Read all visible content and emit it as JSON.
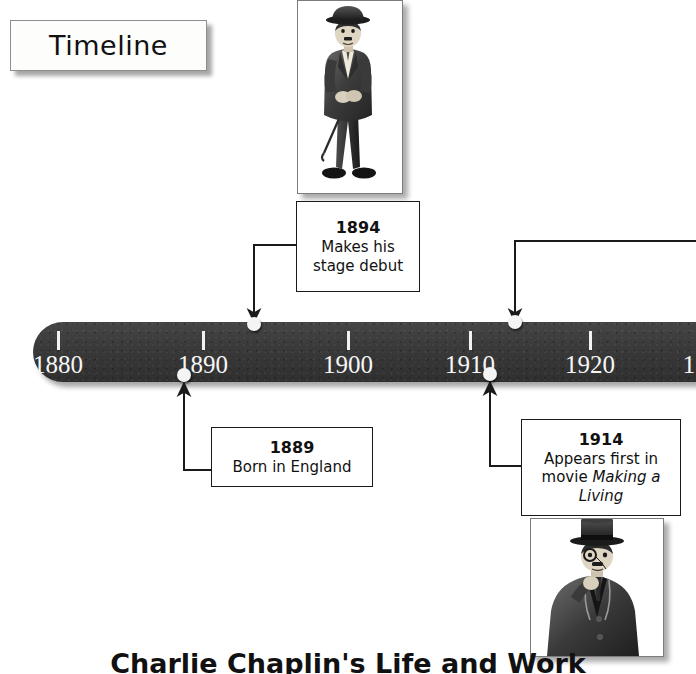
{
  "title": {
    "label": "Timeline"
  },
  "caption": {
    "text": "Charlie Chaplin's Life and Work"
  },
  "axis": {
    "ticks": [
      {
        "label": "1880",
        "x": 58
      },
      {
        "label": "1890",
        "x": 203
      },
      {
        "label": "1900",
        "x": 348
      },
      {
        "label": "1910",
        "x": 470
      },
      {
        "label": "1920",
        "x": 590
      },
      {
        "label": "1",
        "x": 689
      }
    ]
  },
  "events": [
    {
      "id": "event-1889",
      "year": "1889",
      "description": "Born in England",
      "description_italic": "",
      "dot_x": 184,
      "dot_y": 375,
      "box_x": 211,
      "box_y": 427,
      "box_w": 160,
      "box_h": 58,
      "side": "below"
    },
    {
      "id": "event-1894",
      "year": "1894",
      "description": "Makes his stage debut",
      "description_italic": "",
      "dot_x": 254,
      "dot_y": 324,
      "box_x": 296,
      "box_y": 201,
      "box_w": 122,
      "box_h": 89,
      "side": "above"
    },
    {
      "id": "event-1914",
      "year": "1914",
      "description": "Appears first in movie ",
      "description_italic": "Making a Living",
      "dot_x": 490,
      "dot_y": 374,
      "box_x": 521,
      "box_y": 419,
      "box_w": 158,
      "box_h": 95,
      "side": "below"
    },
    {
      "id": "event-offscreen-right",
      "year": "",
      "description": "",
      "description_italic": "",
      "dot_x": 515,
      "dot_y": 322,
      "box_x": 696,
      "box_y": 240,
      "box_w": 0,
      "box_h": 0,
      "side": "above"
    }
  ],
  "illustrations": [
    {
      "id": "chaplin-full-figure",
      "name": "chaplin-standing-illustration",
      "x": 297,
      "y": 0,
      "w": 104,
      "h": 192
    },
    {
      "id": "chaplin-top-hat-figure",
      "name": "chaplin-tophat-illustration",
      "x": 530,
      "y": 518,
      "w": 132,
      "h": 137
    }
  ],
  "colors": {
    "bar": "#3a3a3a",
    "bar_text": "#f6f6f6",
    "dot": "#f4f4f4",
    "box_border": "#1a1a1a",
    "page_bg": "#ffffff",
    "ink": "#111111"
  }
}
